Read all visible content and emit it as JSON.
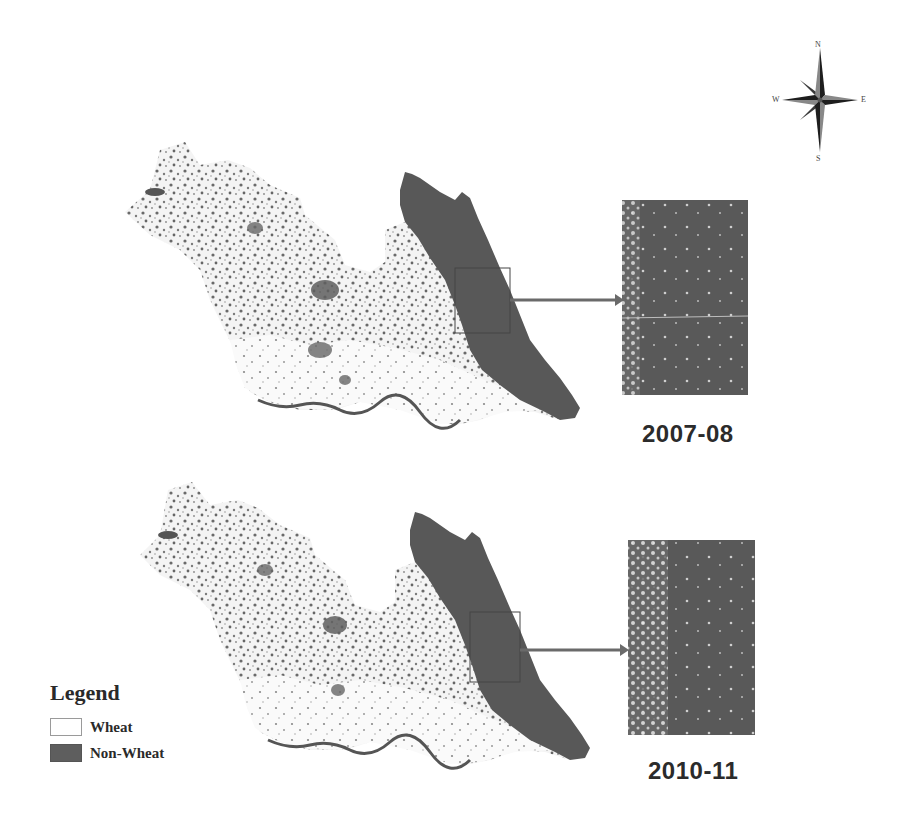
{
  "figure": {
    "type": "thematic-map",
    "panels": [
      {
        "id": "top",
        "year_label": "2007-08",
        "inset_label": "2007-08"
      },
      {
        "id": "bottom",
        "year_label": "2010-11",
        "inset_label": "2010-11"
      }
    ],
    "legend": {
      "title": "Legend",
      "items": [
        {
          "label": "Wheat",
          "color": "#ffffff"
        },
        {
          "label": "Non-Wheat",
          "color": "#5e5e5e"
        }
      ]
    },
    "compass": {
      "icon": "north-arrow-compass-rose-icon",
      "n": "N",
      "s": "S",
      "e": "E",
      "w": "W"
    },
    "colors": {
      "background": "#ffffff",
      "non_wheat": "#5a5a5a",
      "wheat": "#ffffff",
      "speckle": "#6e6e6e",
      "text": "#2b2b2b"
    }
  }
}
